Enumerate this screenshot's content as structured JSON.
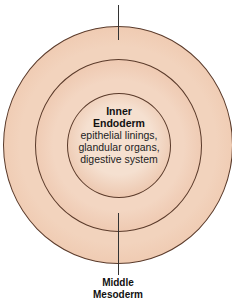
{
  "diagram": {
    "rings": [
      {
        "name": "outer",
        "color": "#eab99a"
      },
      {
        "name": "middle",
        "color": "#e8b597"
      },
      {
        "name": "inner",
        "color": "#e6b394"
      }
    ],
    "inner_label": {
      "title_line1": "Inner",
      "title_line2": "Endoderm",
      "desc_lines": [
        "epithelial linings,",
        "glandular organs,",
        "digestive system"
      ]
    },
    "middle_label": {
      "title_line1": "Middle",
      "title_line2": "Mesoderm"
    },
    "stroke_color": "#5a3a2a"
  }
}
